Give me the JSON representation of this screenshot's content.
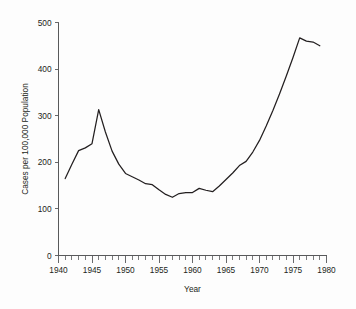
{
  "chart_data": {
    "type": "line",
    "title": "",
    "xlabel": "Year",
    "ylabel": "Cases per 100,000 Population",
    "xlim": [
      1940,
      1980
    ],
    "ylim": [
      0,
      500
    ],
    "grid": false,
    "legend": "none",
    "x_ticks_major": [
      1940,
      1945,
      1950,
      1955,
      1960,
      1965,
      1970,
      1975,
      1980
    ],
    "x_tick_labels": [
      "1940",
      "1945",
      "1950",
      "1955",
      "1960",
      "1965",
      "1970",
      "1975",
      "1980"
    ],
    "x_minor_tick_interval": 1,
    "y_ticks": [
      0,
      100,
      200,
      300,
      400,
      500
    ],
    "y_tick_labels": [
      "0",
      "100",
      "200",
      "300",
      "400",
      "500"
    ],
    "line_color": "#231f20",
    "axis_color": "#58595b",
    "background_color": "#fdfdfd",
    "series": [
      {
        "name": "Cases per 100,000 Population",
        "x": [
          1941,
          1942,
          1943,
          1944,
          1945,
          1946,
          1947,
          1948,
          1949,
          1950,
          1951,
          1952,
          1953,
          1954,
          1955,
          1956,
          1957,
          1958,
          1959,
          1960,
          1961,
          1962,
          1963,
          1964,
          1965,
          1966,
          1967,
          1968,
          1969,
          1970,
          1971,
          1972,
          1973,
          1974,
          1975,
          1976,
          1977,
          1978,
          1979
        ],
        "values": [
          165,
          196,
          225,
          231,
          240,
          313,
          265,
          224,
          196,
          176,
          169,
          162,
          154,
          152,
          141,
          131,
          125,
          133,
          135,
          135,
          144,
          140,
          137,
          149,
          163,
          177,
          193,
          202,
          222,
          247,
          278,
          311,
          347,
          385,
          425,
          467,
          460,
          458,
          450
        ]
      }
    ]
  },
  "axis_titles": {
    "x": "Year",
    "y": "Cases per 100,000 Population"
  }
}
